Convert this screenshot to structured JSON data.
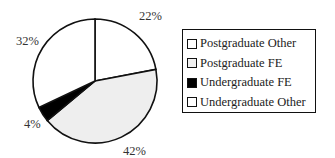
{
  "chart_data": {
    "type": "pie",
    "title": "",
    "categories": [
      "Postgraduate Other",
      "Postgraduate FE",
      "Undergraduate FE",
      "Undergraduate Other"
    ],
    "values": [
      22,
      42,
      4,
      32
    ],
    "labels": [
      "22%",
      "42%",
      "4%",
      "32%"
    ],
    "colors": [
      "#ffffff",
      "#eeeeee",
      "#000000",
      "#ffffff"
    ],
    "start_angle_deg": 0,
    "direction": "clockwise",
    "legend_position": "right"
  },
  "legend": {
    "items": [
      {
        "label": "Postgraduate Other",
        "color": "#ffffff"
      },
      {
        "label": "Postgraduate FE",
        "color": "#f0f0f0"
      },
      {
        "label": "Undergraduate FE",
        "color": "#000000"
      },
      {
        "label": "Undergraduate Other",
        "color": "#ffffff"
      }
    ]
  }
}
